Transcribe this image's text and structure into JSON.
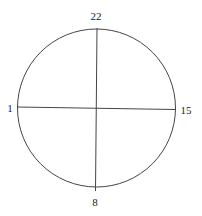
{
  "diagram": {
    "type": "circle-with-crosshair",
    "labels": {
      "top": "22",
      "left": "1",
      "right": "15",
      "bottom": "8"
    },
    "colors": {
      "stroke": "#333333",
      "background": "#ffffff"
    }
  }
}
